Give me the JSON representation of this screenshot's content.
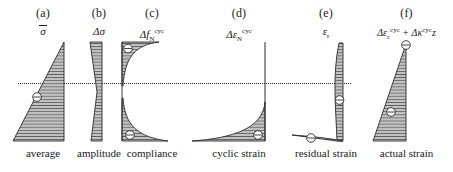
{
  "figure": {
    "type": "engineering-stress-strain-profile-diagram",
    "datum_line": {
      "name": "horizontal-dotted-reference-line",
      "style": "dotted",
      "x_start": 18,
      "x_end": 351,
      "y": 84
    },
    "panels": [
      {
        "id": "a",
        "panel_label": "(a)",
        "symbol_html": "<span class=\"ovl\">σ</span>",
        "symbol_text": "σ̄",
        "bottom_label": "average",
        "shape": "triangle-vertical-right-edge-widening-downward",
        "hatching": "horizontal",
        "markers": 1
      },
      {
        "id": "b",
        "panel_label": "(b)",
        "symbol_html": "Δσ",
        "symbol_text": "Δσ",
        "bottom_label": "amplitude",
        "shape": "narrow-bowtie-pinched-at-mid-height",
        "hatching": "horizontal",
        "markers": 0
      },
      {
        "id": "c",
        "panel_label": "(c)",
        "symbol_html": "Δ<i>f</i><sub>N</sub><sup>cyc</sup>",
        "symbol_text": "Δf_N^cyc",
        "bottom_label": "compliance",
        "shape": "two-concave-lobes-top-left-and-bottom-left",
        "hatching": "horizontal",
        "markers": 2
      },
      {
        "id": "d",
        "panel_label": "(d)",
        "symbol_html": "Δε<sub>N</sub><sup>cyc</sup>",
        "symbol_text": "Δε_N^cyc",
        "bottom_label": "cyclic strain",
        "shape": "vertical-line-with-concave-lobe-sweeping-to-bottom-left",
        "hatching": "horizontal",
        "markers": 1
      },
      {
        "id": "e",
        "panel_label": "(e)",
        "symbol_html": "ε<sub>r</sub>",
        "symbol_text": "ε_r",
        "bottom_label": "residual strain",
        "shape": "curved-sliver-narrow-at-top-widening-then-tapering-to-bottom-left",
        "hatching": "horizontal",
        "markers": 2
      },
      {
        "id": "f",
        "panel_label": "(f)",
        "symbol_html": "Δε<sub>c</sub><sup>cyc</sup> + Δκ<sup>cyc</sup><i>z</i>",
        "symbol_text": "Δε_c^cyc + Δκ^cyc z",
        "bottom_label": "actual strain",
        "shape": "triangle-vertical-right-edge-apex-top-widening-downward",
        "hatching": "horizontal",
        "markers": 2
      }
    ],
    "style": {
      "fill_color": "#b9b9b9",
      "stroke_color": "#2a2a2a",
      "hatch_color": "#3a3a3a",
      "background": "#ffffff"
    }
  }
}
